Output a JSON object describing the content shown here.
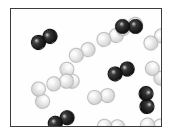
{
  "figure": {
    "kind": "molecular-diagram",
    "background_color": "#ffffff",
    "box": {
      "fill_color": "#fefefe",
      "border_color": "#3b3b3b",
      "border_width": "1.5px",
      "left": 10,
      "top": 8,
      "width": 152,
      "height": 119
    },
    "species": [
      {
        "id": "dark",
        "label": "dark diatomic molecule",
        "color": "#1a1a1a",
        "highlight_color": "#e1e1e1",
        "count": 5
      },
      {
        "id": "light",
        "label": "light diatomic molecule",
        "color": "#e3e3e3",
        "highlight_color": "#ffffff",
        "count": 11
      }
    ],
    "atom_radius": 7.5,
    "bond_offset": 6.2,
    "molecules": [
      {
        "name": "molecule-dark-1",
        "species": "dark",
        "x": 33,
        "y": 30,
        "angle": -28
      },
      {
        "name": "molecule-dark-2",
        "species": "dark",
        "x": 110,
        "y": 62,
        "angle": -22
      },
      {
        "name": "molecule-dark-3",
        "species": "dark",
        "x": 136,
        "y": 91,
        "angle": 86
      },
      {
        "name": "molecule-dark-4",
        "species": "dark",
        "x": 50,
        "y": 111,
        "angle": -25
      },
      {
        "name": "molecule-dark-5",
        "species": "dark",
        "x": 118,
        "y": 17,
        "angle": 0
      },
      {
        "name": "molecule-light-1",
        "species": "light",
        "x": 99,
        "y": 28,
        "angle": -18
      },
      {
        "name": "molecule-light-2",
        "species": "light",
        "x": 145,
        "y": 30,
        "angle": -34
      },
      {
        "name": "molecule-light-3",
        "species": "light",
        "x": 71,
        "y": 43,
        "angle": -26
      },
      {
        "name": "molecule-light-4",
        "species": "light",
        "x": 59,
        "y": 66,
        "angle": 66
      },
      {
        "name": "molecule-light-5",
        "species": "light",
        "x": 146,
        "y": 64,
        "angle": 48
      },
      {
        "name": "molecule-light-6",
        "species": "light",
        "x": 30,
        "y": 86,
        "angle": 72
      },
      {
        "name": "molecule-light-7",
        "species": "light",
        "x": 90,
        "y": 87,
        "angle": -8
      },
      {
        "name": "molecule-light-8",
        "species": "light",
        "x": 100,
        "y": 117,
        "angle": 2
      },
      {
        "name": "molecule-light-9",
        "species": "light",
        "x": 143,
        "y": 116,
        "angle": 4
      },
      {
        "name": "molecule-light-10",
        "species": "light",
        "x": 49,
        "y": 73,
        "angle": -12
      },
      {
        "name": "molecule-light-11",
        "species": "light",
        "x": 118,
        "y": 17,
        "angle": -20
      }
    ]
  }
}
